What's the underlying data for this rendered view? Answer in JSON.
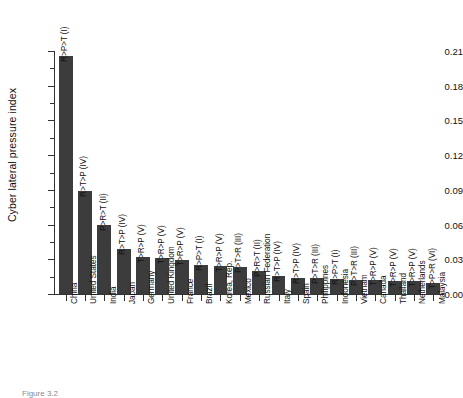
{
  "chart_data": {
    "type": "bar",
    "title": "",
    "subtitle": "",
    "xlabel": "",
    "ylabel": "Cyber lateral pressure index",
    "ylim": [
      0.0,
      0.21
    ],
    "yticks": [
      "0.00",
      "0.03",
      "0.06",
      "0.09",
      "0.12",
      "0.15",
      "0.18",
      "0.21"
    ],
    "ytick_values": [
      0.0,
      0.03,
      0.06,
      0.09,
      0.12,
      0.15,
      0.18,
      0.21
    ],
    "grid": false,
    "legend": "none",
    "orientation": "vertical",
    "bar_color": "#3c3c3c",
    "categories": [
      "China",
      "United States",
      "India",
      "Japan",
      "Germany",
      "United Kingdom",
      "France",
      "Brazil",
      "Korea, Rep.",
      "Mexico",
      "Russian Federation",
      "Italy",
      "Spain",
      "Philippines",
      "Indonesia",
      "Vietnam",
      "Canada",
      "Thailand",
      "Netherlands",
      "Malaysia"
    ],
    "values": [
      0.206,
      0.089,
      0.06,
      0.039,
      0.032,
      0.031,
      0.029,
      0.025,
      0.024,
      0.023,
      0.02,
      0.0155,
      0.014,
      0.0135,
      0.013,
      0.0125,
      0.012,
      0.0115,
      0.011,
      0.0095
    ],
    "bar_annotations": [
      "R>P>T (I)",
      "R>T>P (IV)",
      "P>R>T (II)",
      "R>T>P (IV)",
      "T>R>P (V)",
      "T>R>P (V)",
      "T>R>P (V)",
      "R>P>T (I)",
      "T>R>P (V)",
      "P>T>R (III)",
      "P>R>T (II)",
      "R>T>P (IV)",
      "R>T>P (IV)",
      "P>T>R (III)",
      "R>P>T (I)",
      "P>T>R (III)",
      "T>R>P (V)",
      "T>R>P (V)",
      "T>R>P (V)",
      "T>P>R (VI)"
    ],
    "annotation_note": "Game-theoretic preference ordering label shown above each bar"
  },
  "caption": {
    "text": "Figure 3.2"
  }
}
